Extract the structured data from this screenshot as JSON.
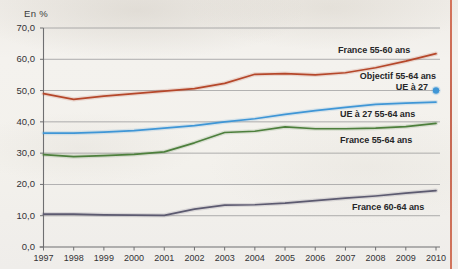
{
  "axis_unit": "En %",
  "colors": {
    "france_55_60": "#b5472a",
    "ue27_55_64": "#3f96d6",
    "france_55_64": "#4d7f3c",
    "france_60_64": "#5c5a70",
    "objectif_dot": "#3f96d6",
    "gridline": "#8d8d8f",
    "axis": "#6f6f71",
    "page_border": "#cd6750",
    "background": "#f2f0ec",
    "text": "#262628"
  },
  "labels": {
    "france_55_60": "France 55-60 ans",
    "objectif_line1": "Objectif 55-64 ans",
    "objectif_line2": "UE à 27",
    "ue27_55_64": "UE à 27 55-64 ans",
    "france_55_64": "France 55-64 ans",
    "france_60_64": "France 60-64 ans"
  },
  "chart_data": {
    "type": "line",
    "title": "",
    "subtitle": "",
    "xlabel": "",
    "ylabel": "En %",
    "ylim": [
      0,
      70
    ],
    "yticks": [
      "0,0",
      "10,0",
      "20,0",
      "30,0",
      "40,0",
      "50,0",
      "60,0",
      "70,0"
    ],
    "ytick_values": [
      0,
      10,
      20,
      30,
      40,
      50,
      60,
      70
    ],
    "grid": "horizontal",
    "legend": "inline-right-of-lines",
    "x": [
      1997,
      1998,
      1999,
      2000,
      2001,
      2002,
      2003,
      2004,
      2005,
      2006,
      2007,
      2008,
      2009,
      2010
    ],
    "categories": [
      "1997",
      "1998",
      "1999",
      "2000",
      "2001",
      "2002",
      "2003",
      "2004",
      "2005",
      "2006",
      "2007",
      "2008",
      "2009",
      "2010"
    ],
    "series": [
      {
        "name": "France 55-60 ans",
        "color": "#b5472a",
        "values": [
          49.0,
          47.2,
          48.2,
          49.0,
          49.8,
          50.6,
          52.3,
          55.2,
          55.4,
          55.0,
          55.7,
          57.3,
          59.4,
          61.8
        ]
      },
      {
        "name": "UE à 27 55-64 ans",
        "color": "#3f96d6",
        "values": [
          36.4,
          36.4,
          36.7,
          37.2,
          38.0,
          38.8,
          40.0,
          41.0,
          42.4,
          43.6,
          44.6,
          45.6,
          46.0,
          46.3
        ]
      },
      {
        "name": "France 55-64 ans",
        "color": "#4d7f3c",
        "values": [
          29.5,
          28.9,
          29.2,
          29.6,
          30.4,
          33.3,
          36.6,
          37.0,
          38.4,
          37.8,
          37.8,
          38.0,
          38.5,
          39.5
        ]
      },
      {
        "name": "France 60-64 ans",
        "color": "#5c5a70",
        "values": [
          10.5,
          10.5,
          10.3,
          10.2,
          10.1,
          12.1,
          13.4,
          13.5,
          14.0,
          14.8,
          15.6,
          16.3,
          17.2,
          18.0
        ]
      }
    ],
    "markers": [
      {
        "name": "Objectif 55-64 ans UE à 27",
        "type": "point",
        "color": "#3f96d6",
        "x": 2010,
        "y": 50.0
      }
    ]
  }
}
